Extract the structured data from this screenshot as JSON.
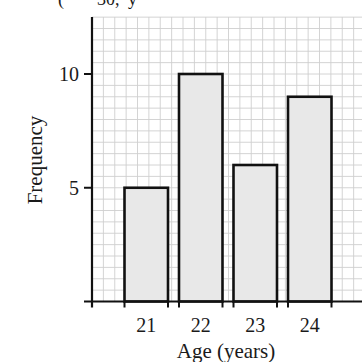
{
  "header": {
    "cropped_text_fragment": "(     30, y"
  },
  "chart_data": {
    "type": "bar",
    "title": "",
    "categories": [
      "21",
      "22",
      "23",
      "24"
    ],
    "values": [
      5,
      10,
      6,
      9
    ],
    "xlabel": "Age (years)",
    "ylabel": "Frequency",
    "ylim": [
      0,
      12.5
    ],
    "yticks": [
      5,
      10
    ],
    "ytick_labels": [
      "5",
      "10"
    ],
    "grid": true,
    "grid_minor_step": 0.5,
    "legend": null,
    "bar_fill": "#e8e8e8",
    "bar_edge": "#111111",
    "grid_color": "#cfcfcf"
  }
}
